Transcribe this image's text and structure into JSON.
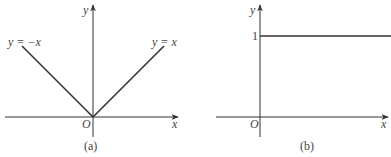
{
  "figure": {
    "panels": [
      {
        "id": "a",
        "caption": "(a)",
        "x_axis_label": "x",
        "y_axis_label": "y",
        "origin_label": "O",
        "curves": [
          {
            "name": "left-branch",
            "label": "y = −x",
            "equation": "y = -x",
            "domain": "x <= 0"
          },
          {
            "name": "right-branch",
            "label": "y = x",
            "equation": "y = x",
            "domain": "x >= 0"
          }
        ]
      },
      {
        "id": "b",
        "caption": "(b)",
        "x_axis_label": "x",
        "y_axis_label": "y",
        "origin_label": "O",
        "y_tick_label": "1",
        "curves": [
          {
            "name": "constant-line",
            "label": "",
            "equation": "y = 1",
            "domain": "x >= 0"
          }
        ]
      }
    ],
    "colors": {
      "stroke": "#333333",
      "text": "#444444",
      "background": "#ffffff"
    }
  }
}
